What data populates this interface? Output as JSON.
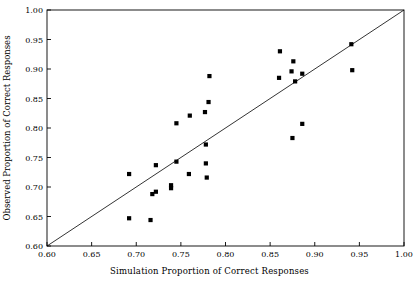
{
  "chart_data": {
    "type": "scatter",
    "title": "",
    "xlabel": "Simulation Proportion of Correct Responses",
    "ylabel": "Observed Proportion of Correct Responses",
    "xlim": [
      0.6,
      1.0
    ],
    "ylim": [
      0.6,
      1.0
    ],
    "xticks": [
      "0.60",
      "0.65",
      "0.70",
      "0.75",
      "0.80",
      "0.85",
      "0.90",
      "0.95",
      "1.00"
    ],
    "yticks": [
      "0.60",
      "0.65",
      "0.70",
      "0.75",
      "0.80",
      "0.85",
      "0.90",
      "0.95",
      "1.00"
    ],
    "grid": false,
    "legend": null,
    "marker": "filled-square",
    "marker_color": "#000000",
    "reference_line": {
      "name": "identity-line",
      "from": [
        0.6,
        0.6
      ],
      "to": [
        1.0,
        1.0
      ],
      "color": "#000000"
    },
    "points": [
      {
        "x": 0.692,
        "y": 0.647
      },
      {
        "x": 0.692,
        "y": 0.722
      },
      {
        "x": 0.716,
        "y": 0.644
      },
      {
        "x": 0.718,
        "y": 0.688
      },
      {
        "x": 0.722,
        "y": 0.692
      },
      {
        "x": 0.722,
        "y": 0.737
      },
      {
        "x": 0.739,
        "y": 0.698
      },
      {
        "x": 0.739,
        "y": 0.703
      },
      {
        "x": 0.745,
        "y": 0.743
      },
      {
        "x": 0.745,
        "y": 0.808
      },
      {
        "x": 0.759,
        "y": 0.722
      },
      {
        "x": 0.76,
        "y": 0.821
      },
      {
        "x": 0.777,
        "y": 0.827
      },
      {
        "x": 0.778,
        "y": 0.74
      },
      {
        "x": 0.778,
        "y": 0.772
      },
      {
        "x": 0.779,
        "y": 0.716
      },
      {
        "x": 0.781,
        "y": 0.844
      },
      {
        "x": 0.782,
        "y": 0.888
      },
      {
        "x": 0.86,
        "y": 0.885
      },
      {
        "x": 0.861,
        "y": 0.93
      },
      {
        "x": 0.874,
        "y": 0.896
      },
      {
        "x": 0.875,
        "y": 0.783
      },
      {
        "x": 0.876,
        "y": 0.913
      },
      {
        "x": 0.878,
        "y": 0.879
      },
      {
        "x": 0.886,
        "y": 0.807
      },
      {
        "x": 0.886,
        "y": 0.892
      },
      {
        "x": 0.941,
        "y": 0.942
      },
      {
        "x": 0.942,
        "y": 0.898
      }
    ]
  }
}
